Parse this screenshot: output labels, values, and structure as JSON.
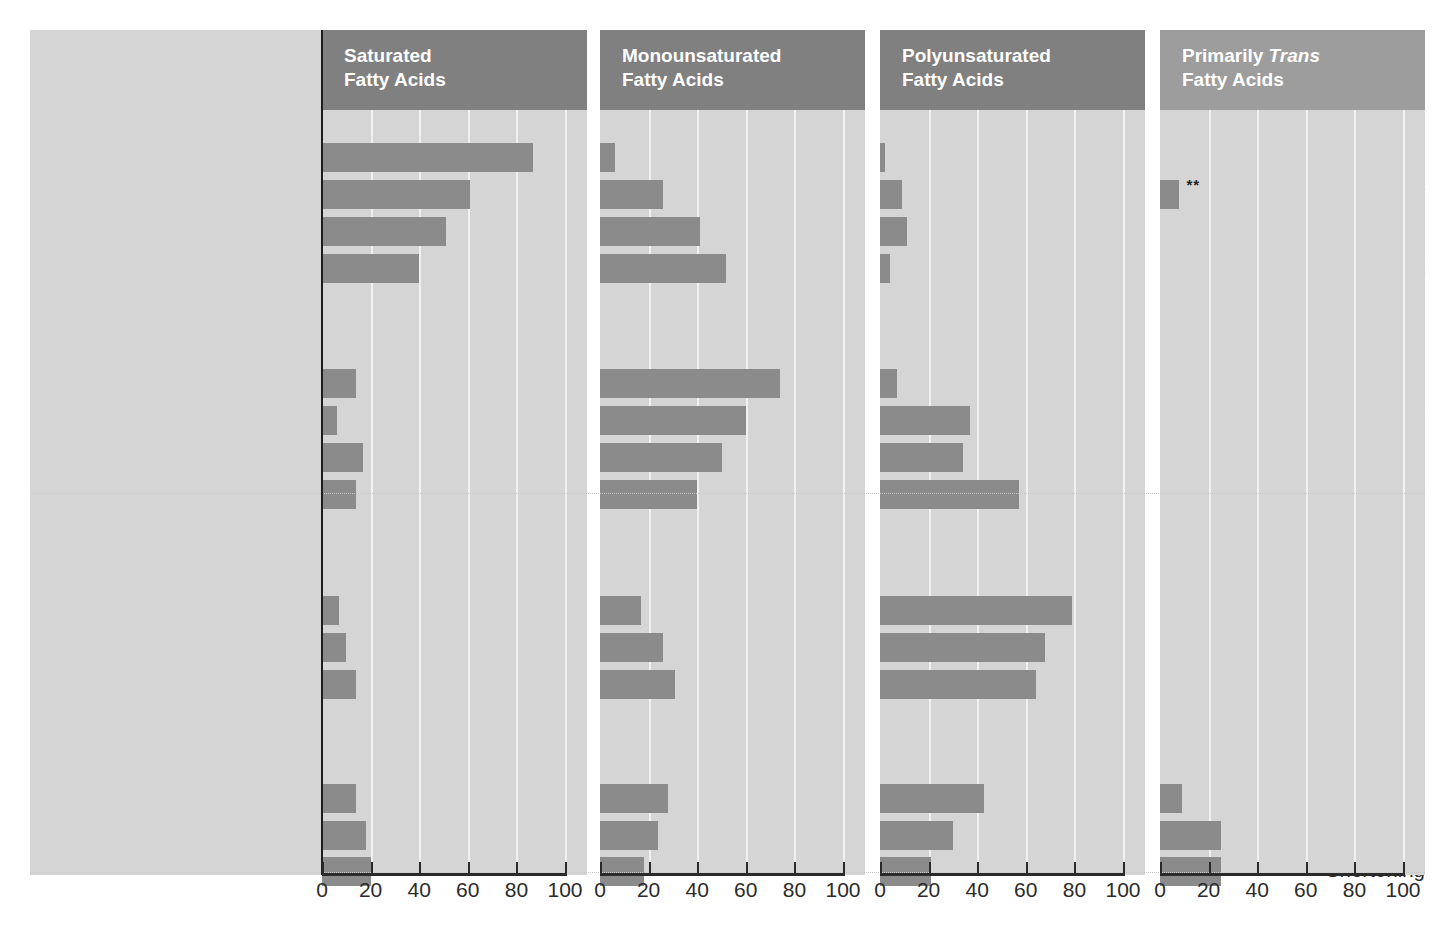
{
  "chart_data": {
    "type": "bar",
    "xlabel": "",
    "ylabel": "",
    "xlim": [
      0,
      100
    ],
    "ticks": [
      0,
      20,
      40,
      60,
      80,
      100
    ],
    "grid": true,
    "legend": "none",
    "orientation": "horizontal",
    "panels": [
      {
        "id": "saturated",
        "label_line1": "Saturated",
        "label_line2": "Fatty Acids",
        "header_shade": "dark"
      },
      {
        "id": "monounsaturated",
        "label_line1": "Monounsaturated",
        "label_line2": "Fatty Acids",
        "header_shade": "dark"
      },
      {
        "id": "polyunsaturated",
        "label_line1": "Polyunsaturated",
        "label_line2": "Fatty Acids",
        "header_shade": "dark"
      },
      {
        "id": "trans",
        "label_line1_pre": "Primarily ",
        "label_line1_em": "Trans",
        "label_line2": "Fatty Acids",
        "header_shade": "light"
      }
    ],
    "groups": [
      {
        "name": "Saturated Fatty Acids",
        "two_line": false
      },
      {
        "name_line1": "Monounsaturated",
        "name_line2": "Fatty Acids",
        "two_line": true
      },
      {
        "name_line1": "Polyunsaturated",
        "name_line2": "Fatty Acids",
        "two_line": true
      },
      {
        "name_em": "Trans",
        "name_rest": " Fatty Acids",
        "two_line": false
      }
    ],
    "categories": [
      "Coconut oil",
      "Butter",
      "Palm oil",
      "Lard or beef fat",
      "Olive oil",
      "Canola oil*",
      "Peanut oil",
      "Soybean oil*",
      "Safflower oil",
      "Sunflower oil",
      "Corn oil",
      "Tub margarine",
      "Stick margarine",
      "Shortening"
    ],
    "series": [
      {
        "name": "Saturated Fatty Acids",
        "values": [
          87,
          61,
          51,
          40,
          14,
          6,
          17,
          14,
          7,
          10,
          14,
          14,
          18,
          20
        ]
      },
      {
        "name": "Monounsaturated Fatty Acids",
        "values": [
          6,
          26,
          41,
          52,
          74,
          60,
          50,
          40,
          17,
          26,
          31,
          28,
          24,
          18
        ]
      },
      {
        "name": "Polyunsaturated Fatty Acids",
        "values": [
          2,
          9,
          11,
          4,
          7,
          37,
          34,
          57,
          79,
          68,
          64,
          43,
          30,
          21
        ]
      },
      {
        "name": "Primarily Trans Fatty Acids",
        "values": [
          0,
          8,
          0,
          0,
          0,
          0,
          0,
          0,
          0,
          0,
          0,
          9,
          25,
          25
        ]
      }
    ],
    "annotations": [
      {
        "text": "**",
        "series": "Primarily Trans Fatty Acids",
        "category": "Butter"
      }
    ],
    "notes": {
      "asterisk": "*",
      "double_asterisk": "**"
    }
  },
  "colors": {
    "panel_background": "#d5d5d5",
    "bar": "#8b8b8b",
    "header_dark": "#808080",
    "header_light": "#9d9d9d",
    "gridline": "#f0f0f0",
    "axis": "#2a2a2a",
    "text": "#2b2b2b"
  },
  "axis": {
    "tick_labels": [
      "0",
      "20",
      "40",
      "60",
      "80",
      "100"
    ]
  }
}
